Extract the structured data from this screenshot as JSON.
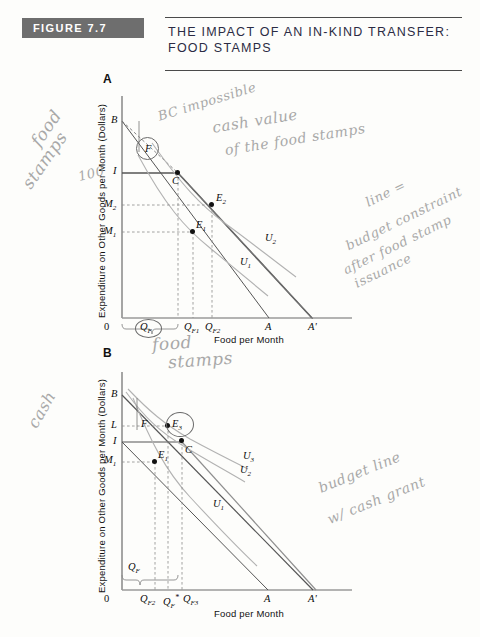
{
  "figure": {
    "badge": "FIGURE 7.7",
    "title_line1": "The Impact of an In-Kind Transfer:",
    "title_line2": "Food Stamps",
    "badge_color": "#6e6e6e"
  },
  "panel_a": {
    "letter": "A",
    "y_axis_title": "Expenditure on Other Goods per Month (Dollars)",
    "x_axis_title": "Food per Month",
    "origin_label": "0",
    "x_ticks": [
      "Q_F",
      "Q_F1",
      "Q_F2",
      "A",
      "A'"
    ],
    "y_ticks": [
      "B",
      "I",
      "M_2",
      "M_1"
    ],
    "points": [
      "F",
      "I",
      "C",
      "E_2",
      "E_1"
    ],
    "curves": [
      "U_1",
      "U_2"
    ],
    "bracket_label": "Q_F"
  },
  "panel_b": {
    "letter": "B",
    "y_axis_title": "Expenditure on Other Goods per Month (Dollars)",
    "x_axis_title": "Food per Month",
    "origin_label": "0",
    "x_ticks": [
      "Q_F2",
      "Q_F*",
      "Q_F3",
      "A",
      "A'"
    ],
    "y_ticks": [
      "B",
      "L",
      "I",
      "M_1"
    ],
    "points": [
      "F",
      "E_3",
      "C",
      "E_1"
    ],
    "curves": [
      "U_1",
      "U_2",
      "U_3"
    ],
    "bracket_label": "Q_F"
  },
  "annotations": [
    {
      "id": "bc-impossible",
      "text": "BC impossible"
    },
    {
      "id": "cash-value",
      "text": "cash value"
    },
    {
      "id": "cash-value-2",
      "text": "of the food stamps"
    },
    {
      "id": "food-stamps-left-1",
      "text": "food"
    },
    {
      "id": "food-stamps-left-2",
      "text": "stamps"
    },
    {
      "id": "hundred",
      "text": "100"
    },
    {
      "id": "budget-constraint-1",
      "text": "line ="
    },
    {
      "id": "budget-constraint-2",
      "text": "budget constraint"
    },
    {
      "id": "budget-constraint-3",
      "text": "after food stamp"
    },
    {
      "id": "budget-constraint-4",
      "text": "issuance"
    },
    {
      "id": "food-stamps-below-1",
      "text": "food"
    },
    {
      "id": "food-stamps-below-2",
      "text": "stamps"
    },
    {
      "id": "cash-left",
      "text": "cash"
    },
    {
      "id": "budget-line-cash-1",
      "text": "budget line"
    },
    {
      "id": "budget-line-cash-2",
      "text": "w/ cash grant"
    }
  ]
}
